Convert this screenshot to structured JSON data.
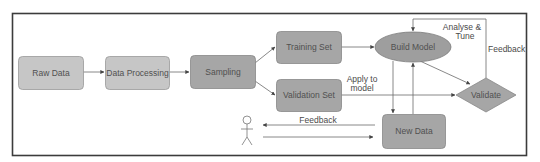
{
  "diagram": {
    "nodes": {
      "raw_data": "Raw Data",
      "data_processing": "Data Processing",
      "sampling": "Sampling",
      "training_set": "Training Set",
      "validation_set": "Validation Set",
      "build_model": "Build Model",
      "validate": "Validate",
      "new_data": "New Data"
    },
    "edge_labels": {
      "analyse_tune_1": "Analyse &",
      "analyse_tune_2": "Tune",
      "feedback_right": "Feedback",
      "apply_to_model_1": "Apply to",
      "apply_to_model_2": "model",
      "feedback_user": "Feedback"
    },
    "colors": {
      "light_box": "#c4c4c4",
      "mid_box": "#ababab",
      "dark_box": "#9c9c9c",
      "stroke": "#8a8a8a",
      "frame": "#3c3c3c",
      "line": "#6a6a6a"
    }
  }
}
